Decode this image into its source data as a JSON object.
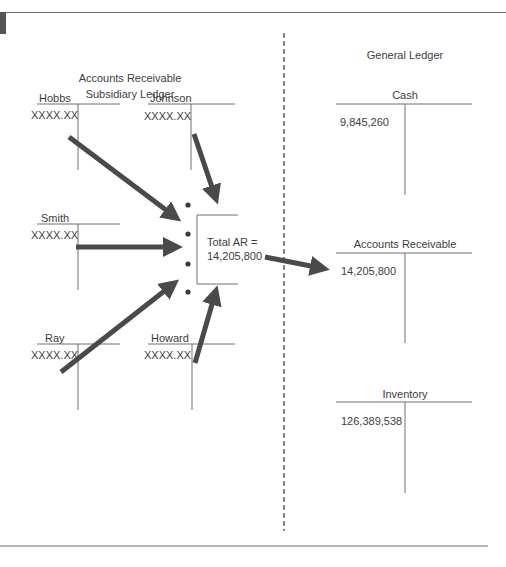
{
  "subsidiary_ledger": {
    "title_line1": "Accounts Receivable",
    "title_line2": "Subsidiary Ledger",
    "accounts": [
      {
        "name": "Hobbs",
        "balance": "XXXX.XX"
      },
      {
        "name": "Johnson",
        "balance": "XXXX.XX"
      },
      {
        "name": "Smith",
        "balance": "XXXX.XX"
      },
      {
        "name": "Ray",
        "balance": "XXXX.XX"
      },
      {
        "name": "Howard",
        "balance": "XXXX.XX"
      }
    ],
    "total_label": "Total AR =",
    "total_value": "14,205,800"
  },
  "general_ledger": {
    "title": "General Ledger",
    "accounts": [
      {
        "name": "Cash",
        "balance": "9,845,260"
      },
      {
        "name": "Accounts Receivable",
        "balance": "14,205,800"
      },
      {
        "name": "Inventory",
        "balance": "126,389,538"
      }
    ]
  },
  "colors": {
    "arrow": "#4a4a4a",
    "line": "#6e6e6e",
    "text": "#3d3d3d",
    "tab_block": "#555555"
  }
}
